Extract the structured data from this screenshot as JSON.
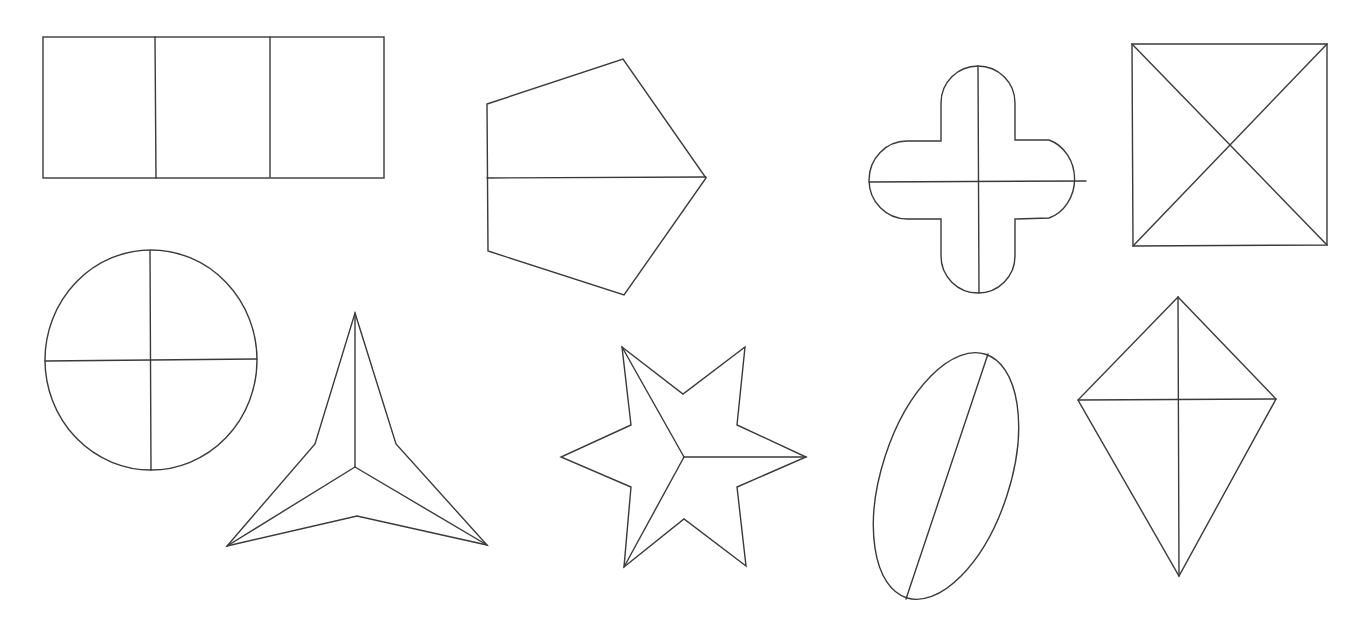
{
  "figure": {
    "background": "#ffffff",
    "stroke_color": "#3a3a3a",
    "shapes": [
      {
        "id": "rectangle",
        "name": "Rectangle divided into three equal parts",
        "parts": 3
      },
      {
        "id": "pentagon",
        "name": "Pentagon divided into two parts",
        "parts": 2
      },
      {
        "id": "rounded-cross",
        "name": "Rounded cross divided into four parts",
        "parts": 4
      },
      {
        "id": "square",
        "name": "Square divided by diagonals into four parts",
        "parts": 4
      },
      {
        "id": "circle",
        "name": "Circle divided into four equal parts",
        "parts": 4
      },
      {
        "id": "three-point-star",
        "name": "Three-pointed star divided into three parts",
        "parts": 3
      },
      {
        "id": "six-point-star",
        "name": "Six-pointed star divided into three parts",
        "parts": 3
      },
      {
        "id": "ellipse",
        "name": "Tilted ellipse divided into two parts",
        "parts": 2
      },
      {
        "id": "kite",
        "name": "Kite divided into four parts",
        "parts": 4
      }
    ]
  }
}
